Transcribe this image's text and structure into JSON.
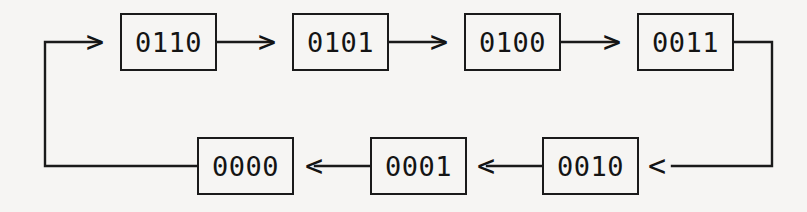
{
  "diagram": {
    "type": "state-transition-cycle",
    "title": "",
    "background_color": "#f6f5f3",
    "stroke_color": "#1a1a1a",
    "text_color": "#141414",
    "states": [
      {
        "id": "s0",
        "label": "0110",
        "row": "top",
        "x": 120,
        "y": 13,
        "w": 97,
        "h": 58
      },
      {
        "id": "s1",
        "label": "0101",
        "row": "top",
        "x": 292,
        "y": 13,
        "w": 97,
        "h": 58
      },
      {
        "id": "s2",
        "label": "0100",
        "row": "top",
        "x": 464,
        "y": 13,
        "w": 97,
        "h": 58
      },
      {
        "id": "s3",
        "label": "0011",
        "row": "top",
        "x": 637,
        "y": 13,
        "w": 97,
        "h": 58
      },
      {
        "id": "s4",
        "label": "0010",
        "row": "bottom",
        "x": 542,
        "y": 137,
        "w": 97,
        "h": 58
      },
      {
        "id": "s5",
        "label": "0001",
        "row": "bottom",
        "x": 370,
        "y": 137,
        "w": 97,
        "h": 58
      },
      {
        "id": "s6",
        "label": "0000",
        "row": "bottom",
        "x": 197,
        "y": 137,
        "w": 97,
        "h": 58
      }
    ],
    "transitions": [
      {
        "from": "s0",
        "to": "s1",
        "arrow": ">"
      },
      {
        "from": "s1",
        "to": "s2",
        "arrow": ">"
      },
      {
        "from": "s2",
        "to": "s3",
        "arrow": ">"
      },
      {
        "from": "s3",
        "to": "s4",
        "arrow": "<"
      },
      {
        "from": "s4",
        "to": "s5",
        "arrow": "<"
      },
      {
        "from": "s5",
        "to": "s6",
        "arrow": "<"
      },
      {
        "from": "s6",
        "to": "s0",
        "arrow": ">"
      }
    ],
    "arrow_glyphs": {
      "right": ">",
      "left": "<"
    }
  }
}
